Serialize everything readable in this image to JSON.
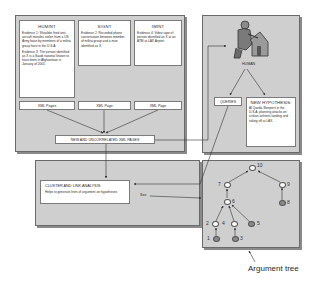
{
  "sources": [
    {
      "title": "HUMINT",
      "evidence": [
        "Evidence 1: Shoulder fired anti-aircraft missiles stolen from a US Army base by members of a militia group here in the U.S.A.",
        "Evidence 3: The person identified as X is a Saudi national known to have been in Afghanistan in January of 2001."
      ],
      "output_label": "XML Pages"
    },
    {
      "title": "SIGNT",
      "evidence": [
        "Evidence 2: Recorded phone conversation between member of militia group and a man identified as X."
      ],
      "output_label": "XML Page"
    },
    {
      "title": "IMINT",
      "evidence": [
        "Evidence 4: Video tape of person identified as X at an ATM at LAX Airport."
      ],
      "output_label": "XML Page"
    }
  ],
  "merge_box": {
    "label": "NEW AND UNCORRELATED XML PAGES"
  },
  "human_panel": {
    "icon": "human-analyst-with-house-icon",
    "label": "HUMAN",
    "queries_label": "QUERIES",
    "hypothesis": {
      "title": "NEW HYPOTHESIS:",
      "text": "Al Qaeda Sleepers in the U.S.A. planning attacks on civilian airliners landing and taking off at LAX."
    }
  },
  "analysis_box": {
    "title": "CLUSTER AND LINK ANALYSIS:",
    "text": "Helps to generate lines of argument on hypotheses",
    "see_label": "See"
  },
  "argument_tree": {
    "caption": "Argument tree",
    "nodes": [
      {
        "id": "10",
        "type": "empty"
      },
      {
        "id": "7",
        "type": "empty"
      },
      {
        "id": "9",
        "type": "empty"
      },
      {
        "id": "8",
        "type": "filled"
      },
      {
        "id": "6",
        "type": "empty"
      },
      {
        "id": "2",
        "type": "empty"
      },
      {
        "id": "4",
        "type": "empty"
      },
      {
        "id": "5",
        "type": "filled"
      },
      {
        "id": "1",
        "type": "filled"
      },
      {
        "id": "3",
        "type": "filled"
      }
    ],
    "edges": [
      [
        "7",
        "10"
      ],
      [
        "9",
        "10"
      ],
      [
        "8",
        "9"
      ],
      [
        "6",
        "7"
      ],
      [
        "2",
        "6"
      ],
      [
        "4",
        "6"
      ],
      [
        "5",
        "6"
      ],
      [
        "1",
        "2"
      ],
      [
        "3",
        "4"
      ]
    ]
  },
  "colors": {
    "panel_bg": "#cfcfcf",
    "box_bg": "#ffffff",
    "filled_node": "#8a8a8a",
    "line": "#333333"
  }
}
